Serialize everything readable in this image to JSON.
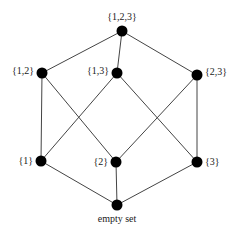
{
  "diagram": {
    "colors": {
      "line": "#444444",
      "node": "#000000",
      "text": "#1a1a1a",
      "background": "#ffffff"
    },
    "nodes": [
      {
        "id": "n123",
        "label": "{1,2,3}",
        "x": 122,
        "y": 31,
        "lx": 122,
        "ly": 20,
        "anchor": "middle"
      },
      {
        "id": "n12",
        "label": "{1,2}",
        "x": 42,
        "y": 73,
        "lx": 34,
        "ly": 74,
        "anchor": "end"
      },
      {
        "id": "n13",
        "label": "{1,3}",
        "x": 117,
        "y": 73,
        "lx": 109,
        "ly": 74,
        "anchor": "end"
      },
      {
        "id": "n23",
        "label": "{2,3}",
        "x": 197,
        "y": 75,
        "lx": 205,
        "ly": 75,
        "anchor": "start"
      },
      {
        "id": "n1",
        "label": "{1}",
        "x": 41,
        "y": 161,
        "lx": 33,
        "ly": 164,
        "anchor": "end"
      },
      {
        "id": "n2",
        "label": "{2}",
        "x": 116,
        "y": 162,
        "lx": 108,
        "ly": 165,
        "anchor": "end"
      },
      {
        "id": "n3",
        "label": "{3}",
        "x": 197,
        "y": 162,
        "lx": 205,
        "ly": 165,
        "anchor": "start"
      },
      {
        "id": "n0",
        "label": "empty set",
        "x": 117,
        "y": 205,
        "lx": 117,
        "ly": 222,
        "anchor": "middle"
      }
    ],
    "edges": [
      [
        "n123",
        "n12"
      ],
      [
        "n123",
        "n13"
      ],
      [
        "n123",
        "n23"
      ],
      [
        "n12",
        "n1"
      ],
      [
        "n12",
        "n2"
      ],
      [
        "n13",
        "n1"
      ],
      [
        "n13",
        "n3"
      ],
      [
        "n23",
        "n2"
      ],
      [
        "n23",
        "n3"
      ],
      [
        "n1",
        "n0"
      ],
      [
        "n2",
        "n0"
      ],
      [
        "n3",
        "n0"
      ]
    ]
  }
}
